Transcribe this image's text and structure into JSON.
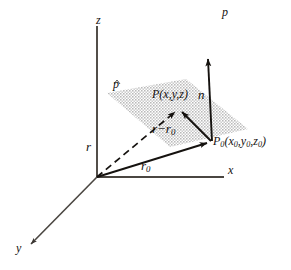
{
  "figure": {
    "kind": "3d-vector-plane-diagram",
    "background_color": "#ffffff",
    "ink_color": "#15120f",
    "plane_fill_color": "#cfcfcf",
    "width": 291,
    "height": 270
  },
  "axes": {
    "z_label": "z",
    "x_label": "x",
    "y_label": "y"
  },
  "plane": {
    "label": "p",
    "top_right_label": "p"
  },
  "points": {
    "p_label": "P",
    "p_coords": "(x,y,z)",
    "p0_label": "P",
    "p0_sub": "0",
    "p0_coords": "(x",
    "p0_coords_2": ",y",
    "p0_coords_3": ",z",
    "p0_coords_4": ")",
    "p0_sub_x": "0",
    "p0_sub_y": "0",
    "p0_sub_z": "0"
  },
  "vectors": {
    "r_label": "r",
    "r0_label": "r",
    "r0_sub": "0",
    "diff_label": "r−r",
    "diff_sub": "0",
    "normal_label": "n"
  }
}
